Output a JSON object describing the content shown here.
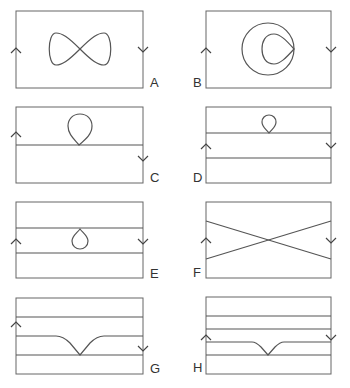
{
  "figure": {
    "stroke_color": "#555555",
    "background": "#ffffff",
    "panels": [
      {
        "id": "A",
        "label": "A",
        "shape": "figure-eight (lemniscate) loop",
        "horizontal_lines": 0,
        "label_position": "bottom-right"
      },
      {
        "id": "B",
        "label": "B",
        "shape": "circle with inner teardrop loop touching circle at right",
        "horizontal_lines": 0,
        "label_position": "bottom-left"
      },
      {
        "id": "C",
        "label": "C",
        "shape": "teardrop loop sitting on one horizontal line",
        "horizontal_lines": 1,
        "label_position": "bottom-right"
      },
      {
        "id": "D",
        "label": "D",
        "shape": "small teardrop loop on upper of two horizontal lines",
        "horizontal_lines": 2,
        "label_position": "bottom-left"
      },
      {
        "id": "E",
        "label": "E",
        "shape": "small teardrop hanging below upper of two horizontal lines",
        "horizontal_lines": 2,
        "label_position": "bottom-right"
      },
      {
        "id": "F",
        "label": "F",
        "shape": "two crossing diagonal lines (X)",
        "horizontal_lines": 0,
        "label_position": "bottom-left"
      },
      {
        "id": "G",
        "label": "G",
        "shape": "three horizontal lines, middle one dipping in V to touch lower line",
        "horizontal_lines": 3,
        "label_position": "bottom-right"
      },
      {
        "id": "H",
        "label": "H",
        "shape": "four horizontal lines, third one dipping in V to touch lowest line",
        "horizontal_lines": 4,
        "label_position": "bottom-left"
      }
    ],
    "arrows": {
      "left": "up",
      "right": "down"
    }
  }
}
